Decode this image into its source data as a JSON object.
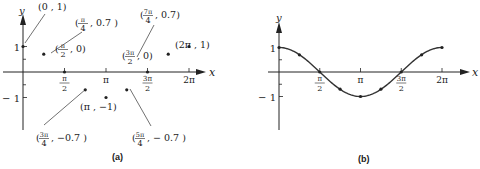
{
  "chart_data": [
    {
      "type": "scatter",
      "panel_label": "(a)",
      "xlabel": "x",
      "ylabel": "y",
      "xlim": [
        0,
        6.2832
      ],
      "ylim": [
        -1,
        1
      ],
      "x_ticks": [
        {
          "value": 1.5708,
          "label_num": "π",
          "label_den": "2"
        },
        {
          "value": 3.1416,
          "label": "π"
        },
        {
          "value": 4.7124,
          "label_num": "3π",
          "label_den": "2"
        },
        {
          "value": 6.2832,
          "label": "2π"
        }
      ],
      "y_ticks": [
        {
          "value": 1,
          "label": "1"
        },
        {
          "value": -1,
          "label": "− 1"
        }
      ],
      "points": [
        {
          "x": 0,
          "y": 1,
          "label": "(0 , 1)"
        },
        {
          "x": 0.7854,
          "y": 0.7,
          "label_pre": "(",
          "label_num": "π",
          "label_den": "4",
          "label_post": ", 0.7 )"
        },
        {
          "x": 1.5708,
          "y": 0,
          "label_pre": "(",
          "label_num": "π",
          "label_den": "2",
          "label_post": ", 0)"
        },
        {
          "x": 2.3562,
          "y": -0.7,
          "label_pre": "(",
          "label_num": "3π",
          "label_den": "4",
          "label_post": ", −0.7 )"
        },
        {
          "x": 3.1416,
          "y": -1,
          "label": "(π , −1)"
        },
        {
          "x": 3.927,
          "y": -0.7,
          "label_pre": "(",
          "label_num": "5π",
          "label_den": "4",
          "label_post": ", − 0.7 )"
        },
        {
          "x": 4.7124,
          "y": 0,
          "label_pre": "(",
          "label_num": "3π",
          "label_den": "2",
          "label_post": ", 0)"
        },
        {
          "x": 5.4978,
          "y": 0.7,
          "label_pre": "(",
          "label_num": "7π",
          "label_den": "4",
          "label_post": ", 0.7)"
        },
        {
          "x": 6.2832,
          "y": 1,
          "label": "(2π , 1)"
        }
      ]
    },
    {
      "type": "line",
      "panel_label": "(b)",
      "function": "y = cos x",
      "xlabel": "x",
      "ylabel": "y",
      "xlim": [
        0,
        6.2832
      ],
      "ylim": [
        -1,
        1
      ],
      "x_ticks": [
        {
          "value": 1.5708,
          "label_num": "π",
          "label_den": "2"
        },
        {
          "value": 3.1416,
          "label": "π"
        },
        {
          "value": 4.7124,
          "label_num": "3π",
          "label_den": "2"
        },
        {
          "value": 6.2832,
          "label": "2π"
        }
      ],
      "y_ticks": [
        {
          "value": 1,
          "label": "1"
        },
        {
          "value": -1,
          "label": "− 1"
        }
      ],
      "points": [
        {
          "x": 0,
          "y": 1
        },
        {
          "x": 0.7854,
          "y": 0.7
        },
        {
          "x": 1.5708,
          "y": 0
        },
        {
          "x": 2.3562,
          "y": -0.7
        },
        {
          "x": 3.1416,
          "y": -1
        },
        {
          "x": 3.927,
          "y": -0.7
        },
        {
          "x": 4.7124,
          "y": 0
        },
        {
          "x": 5.4978,
          "y": 0.7
        },
        {
          "x": 6.2832,
          "y": 1
        }
      ]
    }
  ]
}
